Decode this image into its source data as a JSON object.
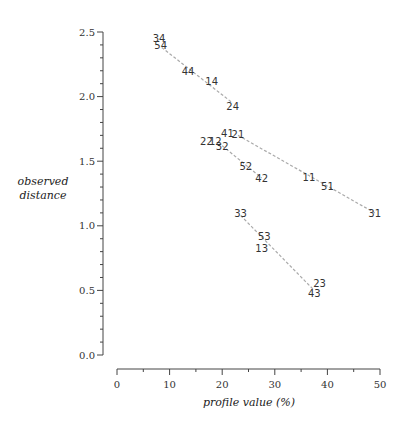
{
  "chart_data": {
    "type": "scatter",
    "title": "",
    "xlabel": "profile value (%)",
    "ylabel": [
      "observed",
      "distance"
    ],
    "xlim": [
      0,
      50
    ],
    "ylim": [
      0,
      2.5
    ],
    "x_ticks": [
      "0",
      "10",
      "20",
      "30",
      "40",
      "50"
    ],
    "y_ticks": [
      "0.0",
      "0.5",
      "1.0",
      "1.5",
      "2.0",
      "2.5"
    ],
    "grid": false,
    "legend": "none",
    "points": [
      {
        "label": "34",
        "x": 8.0,
        "y": 2.45
      },
      {
        "label": "54",
        "x": 8.3,
        "y": 2.4
      },
      {
        "label": "44",
        "x": 13.5,
        "y": 2.2
      },
      {
        "label": "14",
        "x": 18.0,
        "y": 2.12
      },
      {
        "label": "24",
        "x": 22.0,
        "y": 1.93
      },
      {
        "label": "41",
        "x": 21.0,
        "y": 1.72
      },
      {
        "label": "21",
        "x": 23.0,
        "y": 1.71
      },
      {
        "label": "22",
        "x": 17.0,
        "y": 1.66
      },
      {
        "label": "12",
        "x": 18.7,
        "y": 1.66
      },
      {
        "label": "32",
        "x": 20.0,
        "y": 1.62
      },
      {
        "label": "52",
        "x": 24.5,
        "y": 1.46
      },
      {
        "label": "42",
        "x": 27.5,
        "y": 1.37
      },
      {
        "label": "11",
        "x": 36.5,
        "y": 1.38
      },
      {
        "label": "51",
        "x": 40.0,
        "y": 1.31
      },
      {
        "label": "31",
        "x": 49.0,
        "y": 1.1
      },
      {
        "label": "33",
        "x": 23.5,
        "y": 1.1
      },
      {
        "label": "53",
        "x": 28.0,
        "y": 0.92
      },
      {
        "label": "13",
        "x": 27.5,
        "y": 0.83
      },
      {
        "label": "23",
        "x": 38.5,
        "y": 0.56
      },
      {
        "label": "43",
        "x": 37.5,
        "y": 0.48
      }
    ],
    "connecting_lines": [
      {
        "from": [
          8.5,
          2.38
        ],
        "to": [
          22.0,
          1.95
        ]
      },
      {
        "from": [
          20.0,
          1.62
        ],
        "to": [
          27.5,
          1.37
        ]
      },
      {
        "from": [
          23.0,
          1.7
        ],
        "to": [
          49.0,
          1.1
        ]
      },
      {
        "from": [
          23.5,
          1.08
        ],
        "to": [
          37.5,
          0.5
        ]
      }
    ],
    "colors": {
      "line": "#aaaaaa",
      "text": "#333333",
      "axis": "#444444"
    }
  }
}
